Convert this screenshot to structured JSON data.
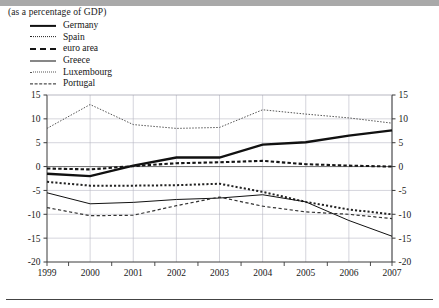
{
  "subtitle": "(as a percentage of GDP)",
  "legend": {
    "items": [
      {
        "label": "Germany",
        "style": "solid-thick",
        "key": "germany"
      },
      {
        "label": "Spain",
        "style": "dotted",
        "key": "spain"
      },
      {
        "label": "euro area",
        "style": "dashed-sq",
        "key": "euro_area"
      },
      {
        "label": "Greece",
        "style": "solid-thin",
        "key": "greece"
      },
      {
        "label": "Luxembourg",
        "style": "dotted-fine",
        "key": "luxembourg"
      },
      {
        "label": "Portugal",
        "style": "dashed-long",
        "key": "portugal"
      }
    ]
  },
  "chart_data": {
    "type": "line",
    "title": "",
    "subtitle": "(as a percentage of GDP)",
    "xlabel": "",
    "ylabel": "",
    "ylim": [
      -20,
      15
    ],
    "yticks": [
      15,
      10,
      5,
      0,
      -5,
      -10,
      -15,
      -20
    ],
    "ytick_labels_left": [
      "15",
      "10",
      "5",
      "0",
      "-5",
      "-10",
      "-15",
      "-20"
    ],
    "ytick_labels_right": [
      "15",
      "10",
      "5",
      "0",
      "-5",
      "-10",
      "-15",
      "-20"
    ],
    "x": [
      1999,
      2000,
      2001,
      2002,
      2003,
      2004,
      2005,
      2006,
      2007
    ],
    "xtick_labels": [
      "1999",
      "2000",
      "2001",
      "2002",
      "2003",
      "2004",
      "2005",
      "2006",
      "2007"
    ],
    "grid": true,
    "legend_position": "top-left",
    "zero_line": 0,
    "series": [
      {
        "name": "Germany",
        "style": "solid-thick",
        "color": "#111111",
        "values": [
          -1.5,
          -2.0,
          0.2,
          1.9,
          1.9,
          4.6,
          5.1,
          6.5,
          7.6
        ]
      },
      {
        "name": "Spain",
        "style": "dotted",
        "color": "#222222",
        "values": [
          -3.2,
          -4.0,
          -4.0,
          -3.9,
          -3.6,
          -5.3,
          -7.4,
          -9.0,
          -10.0
        ]
      },
      {
        "name": "euro area",
        "style": "dashed-sq",
        "color": "#151515",
        "values": [
          -0.4,
          -0.6,
          0.1,
          0.7,
          0.9,
          1.2,
          0.5,
          0.2,
          0.0
        ]
      },
      {
        "name": "Greece",
        "style": "solid-thin",
        "color": "#111111",
        "values": [
          -5.5,
          -7.8,
          -7.5,
          -6.9,
          -6.6,
          -5.9,
          -7.4,
          -11.3,
          -14.6
        ]
      },
      {
        "name": "Luxembourg",
        "style": "dotted-fine",
        "color": "#555555",
        "values": [
          8.0,
          13.0,
          8.8,
          8.0,
          8.2,
          11.9,
          11.0,
          10.2,
          9.1
        ]
      },
      {
        "name": "Portugal",
        "style": "dashed-long",
        "color": "#333333",
        "values": [
          -8.6,
          -10.3,
          -10.2,
          -8.2,
          -6.4,
          -8.3,
          -9.5,
          -10.0,
          -10.9
        ]
      }
    ]
  }
}
